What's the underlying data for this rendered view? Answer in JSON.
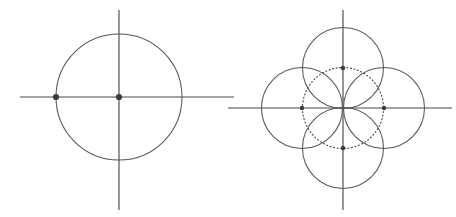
{
  "document": {
    "title": "Geometric Construction Diagram",
    "background_color": "#ffffff",
    "width": 456,
    "height": 217,
    "description": "Two line-art geometric constructions: a single circle with crosshair axes, and a four-petal rosette of four overlapping circles with a dotted guide circle."
  },
  "style": {
    "axis_color": "#4a4a4f",
    "circle_color": "#55555b",
    "dotted_circle_color": "#4a4a50",
    "point_color": "#3a3a40",
    "axis_stroke_width": 1.15,
    "circle_stroke_width": 1.05,
    "dotted_dasharray": "1 2.6"
  },
  "figures": [
    {
      "id": "figure-left",
      "name": "single-circle-with-axes",
      "caption": "",
      "center": {
        "x": 119,
        "y": 97
      },
      "axes": {
        "horizontal": {
          "x1": 20,
          "y1": 97,
          "x2": 234,
          "y2": 97
        },
        "vertical": {
          "x1": 119,
          "y1": 10,
          "x2": 119,
          "y2": 210
        }
      },
      "circles": [
        {
          "name": "main-circle",
          "cx": 119,
          "cy": 97,
          "r": 63,
          "style": "solid"
        }
      ],
      "points": [
        {
          "name": "origin-point",
          "cx": 119,
          "cy": 97,
          "r": 3.1
        },
        {
          "name": "left-intersection-point",
          "cx": 56,
          "cy": 97,
          "r": 3.1
        }
      ]
    },
    {
      "id": "figure-right",
      "name": "four-circle-rosette-with-axes",
      "caption": "",
      "center": {
        "x": 343,
        "y": 108
      },
      "axes": {
        "horizontal": {
          "x1": 228,
          "y1": 108,
          "x2": 452,
          "y2": 108
        },
        "vertical": {
          "x1": 343,
          "y1": 10,
          "x2": 343,
          "y2": 210
        }
      },
      "circles": [
        {
          "name": "top-circle",
          "cx": 343,
          "cy": 68,
          "r": 40.5,
          "style": "solid"
        },
        {
          "name": "left-circle",
          "cx": 302,
          "cy": 108,
          "r": 40.5,
          "style": "solid"
        },
        {
          "name": "right-circle",
          "cx": 384,
          "cy": 108,
          "r": 40.5,
          "style": "solid"
        },
        {
          "name": "bottom-circle",
          "cx": 343,
          "cy": 148,
          "r": 40.5,
          "style": "solid"
        },
        {
          "name": "guide-circle",
          "cx": 343,
          "cy": 108,
          "r": 40.5,
          "style": "dotted"
        }
      ],
      "points": [
        {
          "name": "top-center-point",
          "cx": 343,
          "cy": 68,
          "r": 2.2
        },
        {
          "name": "left-center-point",
          "cx": 302,
          "cy": 108,
          "r": 2.2
        },
        {
          "name": "right-center-point",
          "cx": 384,
          "cy": 108,
          "r": 2.2
        },
        {
          "name": "bottom-center-point",
          "cx": 343,
          "cy": 148,
          "r": 2.2
        }
      ]
    }
  ]
}
